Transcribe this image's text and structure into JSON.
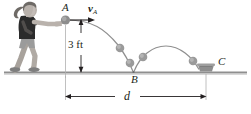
{
  "figure": {
    "ground_label": "",
    "colors": {
      "ink": "#231f20",
      "ground": "#8a8a8a",
      "trajectory": "#8c8c8c",
      "ball": "#9a9a9a",
      "ball_dark": "#6f6f6f",
      "basket": "#8e8e8e",
      "shirt": "#2b2b2b",
      "skin": "#b9b2ac",
      "shorts": "#9b9b9b",
      "hair": "#6e6a66",
      "shoe": "#7e7e7e"
    }
  },
  "labels": {
    "point_a": "A",
    "point_b": "B",
    "point_c": "C",
    "velocity": "v",
    "velocity_sub": "A",
    "height": "3 ft",
    "distance": "d"
  },
  "dimensions": {
    "height_value": "3 ft",
    "distance_value": "d"
  },
  "icons": {
    "thrower": "woman-throwing-icon",
    "ball": "ball-icon",
    "basket": "basket-icon",
    "velocity_arrow": "velocity-arrow-icon",
    "height_dimension": "height-dimension-icon",
    "distance_dimension": "distance-dimension-icon",
    "trajectory": "trajectory-curve-icon",
    "ground": "ground-line-icon"
  }
}
